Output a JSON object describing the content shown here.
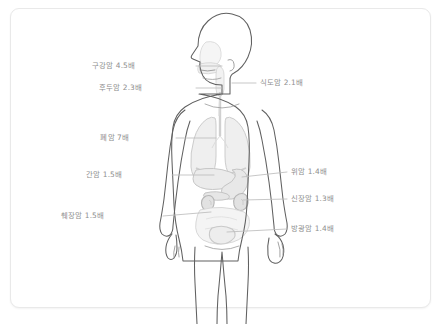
{
  "diagram": {
    "title": "",
    "colors": {
      "card_border": "#e9e9e9",
      "background": "#ffffff",
      "body_outline": "#5a5a5a",
      "organ_fill": "#f2f2f2",
      "organ_stroke": "#c9c9c9",
      "label_text": "#8e8e8e",
      "leader_line": "#bdbdbd"
    },
    "labels": [
      {
        "id": "oral-cancer",
        "text": "구강암 4.5배",
        "side": "left",
        "x": 135,
        "y": 62,
        "line_x1": 196,
        "line_x2": 222,
        "line_y": 66,
        "organ": "mouth"
      },
      {
        "id": "laryngeal-cancer",
        "text": "후두암 2.3배",
        "side": "left",
        "x": 142,
        "y": 84,
        "line_x1": 196,
        "line_x2": 222,
        "line_y": 88,
        "organ": "larynx"
      },
      {
        "id": "esophageal-cancer",
        "text": "식도암 2.1배",
        "side": "right",
        "x": 260,
        "y": 79,
        "line_x1": 232,
        "line_x2": 256,
        "line_y": 83,
        "organ": "esophagus"
      },
      {
        "id": "lung-cancer",
        "text": "폐암 7배",
        "side": "left",
        "x": 129,
        "y": 134,
        "line_x1": 176,
        "line_x2": 216,
        "line_y": 138,
        "organ": "lungs"
      },
      {
        "id": "liver-cancer",
        "text": "간암 1.5배",
        "side": "left",
        "x": 122,
        "y": 171,
        "line_x1": 172,
        "line_x2": 214,
        "line_y": 175,
        "organ": "liver"
      },
      {
        "id": "stomach-cancer",
        "text": "위암 1.4배",
        "side": "right",
        "x": 291,
        "y": 171,
        "line_x1": 242,
        "line_x2": 287,
        "line_y": 177,
        "organ": "stomach"
      },
      {
        "id": "kidney-cancer",
        "text": "신장암 1.3배",
        "side": "right",
        "x": 291,
        "y": 197,
        "line_x1": 243,
        "line_x2": 287,
        "line_y": 200,
        "organ": "kidney"
      },
      {
        "id": "pancreatic-cancer",
        "text": "췌장암 1.5배",
        "side": "left",
        "x": 104,
        "y": 212,
        "line_x1": 163,
        "line_x2": 211,
        "line_y": 216,
        "organ": "pancreas"
      },
      {
        "id": "bladder-cancer",
        "text": "방광암 1.4배",
        "side": "right",
        "x": 291,
        "y": 226,
        "line_x1": 227,
        "line_x2": 287,
        "line_y": 229,
        "organ": "bladder"
      }
    ]
  }
}
